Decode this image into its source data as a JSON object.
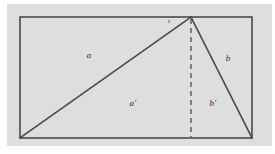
{
  "figure": {
    "background_color": "#ffffff",
    "plate_color": "#dedede",
    "stroke_color": "#4a4a4a",
    "label_color": "#2e2e2e",
    "rectangle": {
      "x1": 20,
      "y1": 17,
      "x2": 252,
      "y2": 138,
      "stroke_width": 1.6
    },
    "apex": {
      "x": 191,
      "y": 17
    },
    "bottom_left": {
      "x": 20,
      "y": 138
    },
    "bottom_right": {
      "x": 252,
      "y": 138
    },
    "altitude": {
      "x": 191,
      "y_top": 19,
      "y_bottom": 138,
      "style": "dashed",
      "dash_pattern": "5,4",
      "stroke_width": 1.7
    },
    "labels": [
      {
        "name": "label-a",
        "text": "a",
        "prime": "",
        "x": 89,
        "y": 55
      },
      {
        "name": "label-a-prime",
        "text": "a",
        "prime": "'",
        "x": 133,
        "y": 103
      },
      {
        "name": "label-b",
        "text": "b",
        "prime": "",
        "x": 228,
        "y": 58
      },
      {
        "name": "label-b-prime",
        "text": "b",
        "prime": "'",
        "x": 213,
        "y": 103
      }
    ],
    "apex_tick": {
      "name": "apex-tick-mark",
      "x": 168,
      "y": 22
    }
  }
}
